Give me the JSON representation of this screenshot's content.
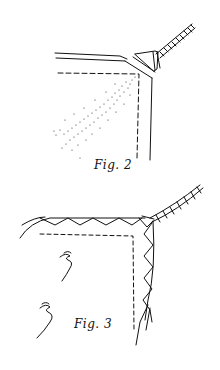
{
  "figures": [
    {
      "id": "fig2",
      "caption": "Fig. 2",
      "description": "Corner of fabric with folded edge, dashed seam line, spray mist and a twisted cord attached at the corner"
    },
    {
      "id": "fig3",
      "caption": "Fig. 3",
      "description": "Corner of fabric with zigzag stitched edges converging to a twisted cord, dashed seam line, squiggle marks"
    }
  ],
  "colors": {
    "ink": "#111111",
    "background": "#ffffff"
  }
}
